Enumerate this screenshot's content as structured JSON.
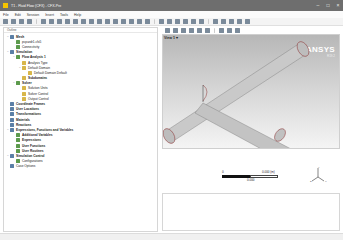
{
  "window": {
    "title": "T1 - Fluid Flow (CFX) - CFX-Pre",
    "controls": [
      "minimize",
      "maximize",
      "close"
    ]
  },
  "menubar": {
    "items": [
      "File",
      "Edit",
      "Session",
      "Insert",
      "Tools",
      "Help"
    ]
  },
  "tree_panel": {
    "header": "Outline",
    "items": [
      {
        "label": "Mesh",
        "level": 0,
        "expander": "−",
        "icon": "mesh-icon",
        "bold": true
      },
      {
        "label": "pcpardr1.cfx5",
        "level": 1,
        "expander": "",
        "icon": "mesh-file-icon",
        "bold": false
      },
      {
        "label": "Connectivity",
        "level": 1,
        "expander": "",
        "icon": "connectivity-icon",
        "bold": false
      },
      {
        "label": "Simulation",
        "level": 0,
        "expander": "−",
        "icon": "simulation-icon",
        "bold": true
      },
      {
        "label": "Flow Analysis 1",
        "level": 1,
        "expander": "−",
        "icon": "flow-analysis-icon",
        "bold": true
      },
      {
        "label": "Analysis Type",
        "level": 2,
        "expander": "",
        "icon": "analysis-type-icon",
        "bold": false
      },
      {
        "label": "Default Domain",
        "level": 2,
        "expander": "−",
        "icon": "domain-icon",
        "bold": false
      },
      {
        "label": "Default Domain Default",
        "level": 3,
        "expander": "",
        "icon": "boundary-icon",
        "bold": false
      },
      {
        "label": "Subdomains",
        "level": 2,
        "expander": "",
        "icon": "subdomains-icon",
        "bold": true
      },
      {
        "label": "Solver",
        "level": 1,
        "expander": "−",
        "icon": "solver-icon",
        "bold": true
      },
      {
        "label": "Solution Units",
        "level": 2,
        "expander": "",
        "icon": "solution-units-icon",
        "bold": false
      },
      {
        "label": "Solver Control",
        "level": 2,
        "expander": "",
        "icon": "solver-control-icon",
        "bold": false
      },
      {
        "label": "Output Control",
        "level": 2,
        "expander": "",
        "icon": "output-control-icon",
        "bold": false
      },
      {
        "label": "Coordinate Frames",
        "level": 0,
        "expander": "",
        "icon": "coordinate-frames-icon",
        "bold": true
      },
      {
        "label": "User Locations",
        "level": 0,
        "expander": "",
        "icon": "user-locations-icon",
        "bold": true
      },
      {
        "label": "Transformations",
        "level": 0,
        "expander": "",
        "icon": "transformations-icon",
        "bold": true
      },
      {
        "label": "Materials",
        "level": 0,
        "expander": "",
        "icon": "materials-icon",
        "bold": true
      },
      {
        "label": "Reactions",
        "level": 0,
        "expander": "",
        "icon": "reactions-icon",
        "bold": true
      },
      {
        "label": "Expressions, Functions and Variables",
        "level": 0,
        "expander": "−",
        "icon": "expressions-icon",
        "bold": true
      },
      {
        "label": "Additional Variables",
        "level": 1,
        "expander": "",
        "icon": "additional-variables-icon",
        "bold": true
      },
      {
        "label": "Expressions",
        "level": 1,
        "expander": "",
        "icon": "expressions-sub-icon",
        "bold": true
      },
      {
        "label": "User Functions",
        "level": 1,
        "expander": "",
        "icon": "user-functions-icon",
        "bold": true
      },
      {
        "label": "User Routines",
        "level": 1,
        "expander": "",
        "icon": "user-routines-icon",
        "bold": true
      },
      {
        "label": "Simulation Control",
        "level": 0,
        "expander": "−",
        "icon": "simulation-control-icon",
        "bold": true
      },
      {
        "label": "Configurations",
        "level": 1,
        "expander": "",
        "icon": "configurations-icon",
        "bold": false
      },
      {
        "label": "Case Options",
        "level": 0,
        "expander": "",
        "icon": "case-options-icon",
        "bold": false
      }
    ]
  },
  "viewport": {
    "view_label": "View 1 ▾",
    "logo_brand": "ANSYS",
    "logo_version": "R19.2",
    "scale": {
      "min": "0",
      "max": "0.000 (m)",
      "mid": "0.000"
    },
    "triad": {
      "x": "X",
      "y": "Y",
      "z": "Z"
    }
  },
  "colors": {
    "titlebar": "#6e6e6e",
    "viewport_top": "#b7b7b7",
    "viewport_bottom": "#f4f4f4",
    "pipe": "#c9c9c9",
    "pipe_edge": "#555555",
    "pipe_end": "#8d3535",
    "logo": "#ffffff"
  }
}
